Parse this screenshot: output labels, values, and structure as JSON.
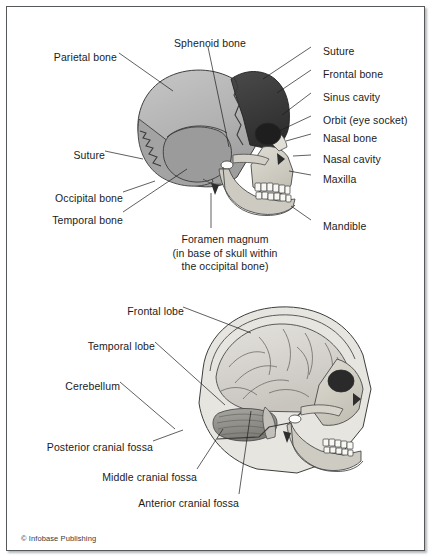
{
  "figure": {
    "copyright": "© Infobase Publishing",
    "frame_color": "#55595c",
    "background_color": "#ffffff"
  },
  "palette": {
    "bone_light": "#b9b9b9",
    "bone_mid": "#9a9a9a",
    "bone_dark": "#3a3a3a",
    "bone_pale": "#dedad2",
    "face_bone": "#c9c6bd",
    "teeth": "#f7f6f2",
    "brain": "#d8d6d1",
    "cerebellum": "#8f8d88",
    "outline": "#3a3a3a",
    "text": "#1b1b1b"
  },
  "panels": [
    {
      "id": "skull-lateral",
      "name": "Lateral view of the skull showing cranial bones",
      "labels": [
        {
          "id": "parietal-bone",
          "text": "Parietal bone",
          "side": "left",
          "x": 110,
          "y": 50,
          "line": [
            [
              114,
              54
            ],
            [
              170,
              88
            ]
          ]
        },
        {
          "id": "sphenoid-bone",
          "text": "Sphenoid bone",
          "side": "center",
          "x": 203,
          "y": 36,
          "line": [
            [
              203,
              50
            ],
            [
              222,
              140
            ]
          ]
        },
        {
          "id": "suture-top",
          "text": "Suture",
          "side": "right",
          "x": 316,
          "y": 44,
          "line": [
            [
              312,
              48
            ],
            [
              258,
              76
            ]
          ]
        },
        {
          "id": "frontal-bone",
          "text": "Frontal bone",
          "side": "right",
          "x": 316,
          "y": 67,
          "line": [
            [
              312,
              71
            ],
            [
              272,
              90
            ]
          ]
        },
        {
          "id": "sinus-cavity",
          "text": "Sinus cavity",
          "side": "right",
          "x": 316,
          "y": 90,
          "line": [
            [
              312,
              94
            ],
            [
              277,
              112
            ]
          ]
        },
        {
          "id": "orbit",
          "text": "Orbit (eye socket)",
          "side": "right",
          "x": 316,
          "y": 113,
          "line": [
            [
              312,
              117
            ],
            [
              276,
              128
            ]
          ]
        },
        {
          "id": "nasal-bone",
          "text": "Nasal bone",
          "side": "right",
          "x": 316,
          "y": 131,
          "line": [
            [
              312,
              135
            ],
            [
              281,
              138
            ]
          ]
        },
        {
          "id": "nasal-cavity",
          "text": "Nasal cavity",
          "side": "right",
          "x": 316,
          "y": 152,
          "line": [
            [
              312,
              154
            ],
            [
              288,
              154
            ]
          ]
        },
        {
          "id": "maxilla",
          "text": "Maxilla",
          "side": "right",
          "x": 316,
          "y": 172,
          "line": [
            [
              312,
              175
            ],
            [
              284,
              170
            ]
          ]
        },
        {
          "id": "mandible",
          "text": "Mandible",
          "side": "right",
          "x": 316,
          "y": 220,
          "line": [
            [
              312,
              219
            ],
            [
              286,
              206
            ]
          ]
        },
        {
          "id": "suture-left",
          "text": "Suture",
          "side": "left",
          "x": 98,
          "y": 148,
          "line": [
            [
              102,
              152
            ],
            [
              142,
              158
            ]
          ]
        },
        {
          "id": "occipital-bone",
          "text": "Occipital bone",
          "side": "left",
          "x": 116,
          "y": 192,
          "line": [
            [
              120,
              192
            ],
            [
              152,
              180
            ]
          ]
        },
        {
          "id": "temporal-bone",
          "text": "Temporal bone",
          "side": "left",
          "x": 116,
          "y": 214,
          "line": [
            [
              120,
              212
            ],
            [
              180,
              170
            ]
          ]
        }
      ],
      "caption": {
        "id": "foramen-magnum",
        "lines": [
          "Foramen magnum",
          "(in base of skull within",
          "the occipital bone)"
        ],
        "x": 218,
        "y": 229,
        "line": [
          [
            206,
            226
          ],
          [
            206,
            196
          ]
        ]
      }
    },
    {
      "id": "cranial-fossae",
      "name": "Sagittal cutaway showing brain lobes and cranial fossae",
      "labels": [
        {
          "id": "frontal-lobe",
          "text": "Frontal lobe",
          "side": "left",
          "x": 177,
          "y": 304,
          "line": [
            [
              181,
              307
            ],
            [
              247,
              330
            ]
          ]
        },
        {
          "id": "temporal-lobe",
          "text": "Temporal lobe",
          "side": "left",
          "x": 148,
          "y": 339,
          "line": [
            [
              152,
              342
            ],
            [
              222,
              402
            ]
          ]
        },
        {
          "id": "cerebellum",
          "text": "Cerebellum",
          "side": "left",
          "x": 113,
          "y": 379,
          "line": [
            [
              117,
              382
            ],
            [
              170,
              425
            ]
          ]
        },
        {
          "id": "posterior-cranial-fossa",
          "text": "Posterior cranial fossa",
          "side": "left",
          "x": 146,
          "y": 441,
          "line": [
            [
              150,
              441
            ],
            [
              178,
              428
            ]
          ]
        },
        {
          "id": "middle-cranial-fossa",
          "text": "Middle cranial fossa",
          "side": "left",
          "x": 190,
          "y": 471,
          "line": [
            [
              194,
              469
            ],
            [
              218,
              428
            ]
          ]
        },
        {
          "id": "anterior-cranial-fossa",
          "text": "Anterior cranial fossa",
          "side": "left",
          "x": 232,
          "y": 497,
          "line": [
            [
              236,
              494
            ],
            [
              248,
              408
            ]
          ]
        }
      ]
    }
  ]
}
